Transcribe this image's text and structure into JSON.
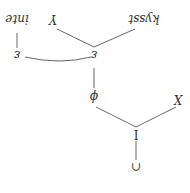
{
  "diagram": {
    "orientation": "rotated 180 degrees",
    "nodes": {
      "root": "∩",
      "inode": "I",
      "x_node": "X",
      "phi_node": "ϕ",
      "eps_main": "ε",
      "y_node": "Y",
      "word_kysst": "kysst",
      "eps_arc": "ε",
      "word_inte": "inte"
    }
  }
}
